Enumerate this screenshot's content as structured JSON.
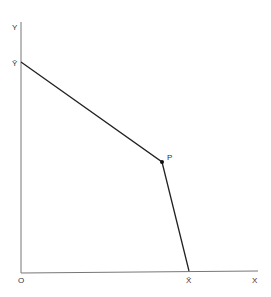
{
  "diagram": {
    "axes": {
      "y_label": "Y",
      "x_label": "X",
      "origin_label": "O"
    },
    "points": {
      "y_bar": {
        "label": "Ȳ"
      },
      "p": {
        "label": "P"
      },
      "x_bar": {
        "label": "X̄"
      }
    },
    "line_color": "#222222"
  }
}
